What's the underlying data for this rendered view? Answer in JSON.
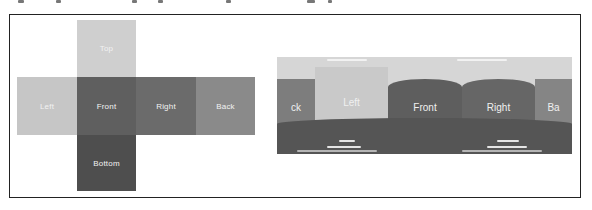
{
  "figure": {
    "left_panel": {
      "title": "Cube map net",
      "faces": [
        {
          "id": "top",
          "label": "Top",
          "color": "#cfcfcf"
        },
        {
          "id": "left",
          "label": "Left",
          "color": "#c6c6c6"
        },
        {
          "id": "front",
          "label": "Front",
          "color": "#5f5f5f"
        },
        {
          "id": "right",
          "label": "Right",
          "color": "#6b6b6b"
        },
        {
          "id": "back",
          "label": "Back",
          "color": "#8a8a8a"
        },
        {
          "id": "bottom",
          "label": "Bottom",
          "color": "#4e4e4e"
        }
      ]
    },
    "right_panel": {
      "title": "Equirectangular panorama",
      "bands": [
        {
          "id": "back-partial-left",
          "label": "ck",
          "color": "#7d7d7d"
        },
        {
          "id": "left",
          "label": "Left",
          "color": "#c9c9c9"
        },
        {
          "id": "front",
          "label": "Front",
          "color": "#5e5e5e"
        },
        {
          "id": "right",
          "label": "Right",
          "color": "#666666"
        },
        {
          "id": "back-partial-right",
          "label": "Ba",
          "color": "#858585"
        }
      ],
      "sky_color": "#d6d6d6",
      "floor_color": "#555555"
    }
  }
}
